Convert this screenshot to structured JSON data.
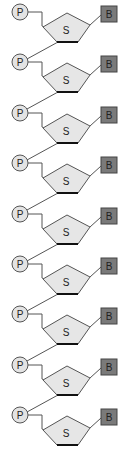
{
  "diagram": {
    "title": "",
    "unit_count": 9,
    "spacing": 50.4,
    "labels": {
      "phosphate": "P",
      "sugar": "S",
      "base": "B"
    },
    "colors": {
      "phosphate_fill": "#e3e3e3",
      "sugar_fill": "#e6e6e6",
      "base_fill": "#7a7a7a",
      "stroke": "#555555",
      "sugar_bottom_edge": "#111111"
    },
    "units": [
      {
        "index": 0,
        "p": "P",
        "s": "S",
        "b": "B"
      },
      {
        "index": 1,
        "p": "P",
        "s": "S",
        "b": "B"
      },
      {
        "index": 2,
        "p": "P",
        "s": "S",
        "b": "B"
      },
      {
        "index": 3,
        "p": "P",
        "s": "S",
        "b": "B"
      },
      {
        "index": 4,
        "p": "P",
        "s": "S",
        "b": "B"
      },
      {
        "index": 5,
        "p": "P",
        "s": "S",
        "b": "B"
      },
      {
        "index": 6,
        "p": "P",
        "s": "S",
        "b": "B"
      },
      {
        "index": 7,
        "p": "P",
        "s": "S",
        "b": "B"
      },
      {
        "index": 8,
        "p": "P",
        "s": "S",
        "b": "B"
      }
    ]
  }
}
